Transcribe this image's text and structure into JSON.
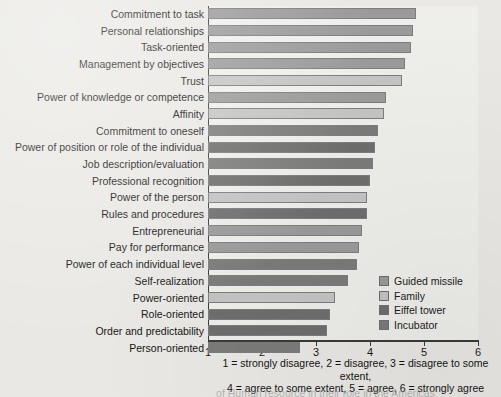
{
  "chart_data": {
    "type": "bar",
    "orientation": "horizontal",
    "title": "",
    "xlabel": "",
    "ylabel": "",
    "xlim": [
      1,
      6
    ],
    "xticks": [
      1,
      2,
      3,
      4,
      5,
      6
    ],
    "grid": false,
    "legend_position": "inside-right-lower",
    "categories": [
      "Commitment to task",
      "Personal relationships",
      "Task-oriented",
      "Management by objectives",
      "Trust",
      "Power of knowledge or competence",
      "Affinity",
      "Commitment to oneself",
      "Power of position or role of the individual",
      "Job description/evaluation",
      "Professional recognition",
      "Power of the person",
      "Rules and procedures",
      "Entrepreneurial",
      "Pay for performance",
      "Power of each individual level",
      "Self-realization",
      "Power-oriented",
      "Role-oriented",
      "Order and predictability",
      "Person-oriented"
    ],
    "values": [
      4.85,
      4.8,
      4.75,
      4.65,
      4.6,
      4.3,
      4.25,
      4.15,
      4.1,
      4.05,
      4.0,
      3.95,
      3.95,
      3.85,
      3.8,
      3.75,
      3.6,
      3.35,
      3.25,
      3.2,
      2.7
    ],
    "series_assignment": [
      "Guided missile",
      "Guided missile",
      "Guided missile",
      "Guided missile",
      "Family",
      "Guided missile",
      "Family",
      "Incubator",
      "Eiffel tower",
      "Incubator",
      "Eiffel tower",
      "Family",
      "Eiffel tower",
      "Guided missile",
      "Guided missile",
      "Incubator",
      "Incubator",
      "Family",
      "Eiffel tower",
      "Eiffel tower",
      "Incubator"
    ],
    "series": [
      {
        "name": "Guided missile",
        "color": "#9a9a9a"
      },
      {
        "name": "Family",
        "color": "#c4c4c4"
      },
      {
        "name": "Eiffel tower",
        "color": "#6e6e6e"
      },
      {
        "name": "Incubator",
        "color": "#7b7b7b"
      }
    ],
    "legend": [
      "Guided missile",
      "Family",
      "Eiffel tower",
      "Incubator"
    ],
    "tick_labels": [
      "1",
      "2",
      "3",
      "4",
      "5",
      "6"
    ],
    "caption_line1": "1 = strongly disagree, 2 = disagree, 3 = disagree to some extent,",
    "caption_line2": "4 = agree to some extent, 5 = agree, 6 = strongly agree",
    "footer_cut_off": "of Human resource in their role in the Americas"
  },
  "colors": {
    "background": "#e9e8e4",
    "plot_background": "#eeeeea",
    "axis": "#3a3a3a",
    "text": "#1b1b1b",
    "guided_missile": "#9a9a9a",
    "family": "#c4c4c4",
    "eiffel_tower": "#6e6e6e",
    "incubator": "#7b7b7b"
  }
}
